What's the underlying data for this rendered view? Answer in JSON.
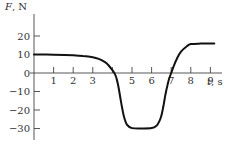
{
  "chart_data": {
    "type": "line",
    "title": "",
    "xlabel_var": "t",
    "xlabel_unit": ", s",
    "ylabel_var": "F",
    "ylabel_unit": ", N",
    "xlim": [
      0,
      9.8
    ],
    "ylim": [
      -35,
      30
    ],
    "x_ticks": [
      1,
      2,
      3,
      4,
      5,
      6,
      7,
      8,
      9
    ],
    "x_tick_labels": [
      "1",
      "2",
      "3",
      "",
      "5",
      "6",
      "7",
      "8",
      "9"
    ],
    "y_ticks": [
      20,
      10,
      0,
      -10,
      -20,
      -30
    ],
    "y_tick_labels": [
      "20",
      "10",
      "0",
      "−10",
      "−20",
      "−30"
    ],
    "grid": false,
    "series": [
      {
        "name": "F(t)",
        "color": "#111111",
        "x": [
          0,
          1,
          2,
          2.5,
          3,
          3.3,
          3.6,
          3.8,
          4.0,
          4.1,
          4.2,
          4.3,
          4.4,
          4.5,
          4.6,
          4.75,
          5.0,
          5.5,
          6.0,
          6.25,
          6.4,
          6.5,
          6.6,
          6.7,
          6.8,
          6.9,
          7.0,
          7.1,
          7.3,
          7.5,
          7.8,
          8.0,
          8.5,
          9.0,
          9.2
        ],
        "y": [
          10,
          9.9,
          9.6,
          9.2,
          8.5,
          7.6,
          6,
          4.2,
          1.5,
          0,
          -2.5,
          -7,
          -13,
          -19,
          -24,
          -28,
          -29.8,
          -30,
          -29.8,
          -28.5,
          -26,
          -23,
          -18,
          -12,
          -7,
          -3,
          0,
          3,
          8,
          11.5,
          14.5,
          15.6,
          15.9,
          16,
          16
        ]
      }
    ]
  }
}
